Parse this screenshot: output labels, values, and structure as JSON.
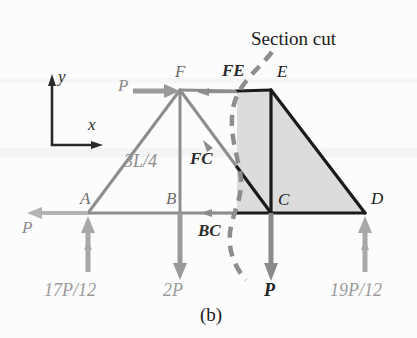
{
  "figure": {
    "caption": "(b)",
    "section_cut_label": "Section cut",
    "colors": {
      "light_member": "#8d8d8d",
      "dark_member": "#1a1a1a",
      "shaded_fill": "#dcdcdc",
      "dashed_cut": "#8d8d8d",
      "background": "#fcfcfc"
    }
  },
  "axes": {
    "x_label": "x",
    "y_label": "y"
  },
  "nodes": [
    {
      "name": "A",
      "label": "A",
      "x": 88,
      "y": 213,
      "tone": "light"
    },
    {
      "name": "B",
      "label": "B",
      "x": 180,
      "y": 213,
      "tone": "light"
    },
    {
      "name": "C",
      "label": "C",
      "x": 271,
      "y": 213,
      "tone": "dark"
    },
    {
      "name": "D",
      "label": "D",
      "x": 365,
      "y": 213,
      "tone": "dark"
    },
    {
      "name": "E",
      "label": "E",
      "x": 271,
      "y": 90,
      "tone": "dark"
    },
    {
      "name": "F",
      "label": "F",
      "x": 180,
      "y": 90,
      "tone": "light"
    }
  ],
  "dimensions": [
    {
      "name": "height-AF",
      "label": "3L/4"
    }
  ],
  "member_forces": [
    {
      "name": "FE",
      "label": "FE",
      "direction": "left",
      "member": "top-chord"
    },
    {
      "name": "FC",
      "label": "FC",
      "direction": "down-right",
      "member": "diagonal"
    },
    {
      "name": "BC",
      "label": "BC",
      "label_text": "BC",
      "direction": "left",
      "member": "bottom-chord"
    }
  ],
  "loads": [
    {
      "name": "load-P-at-F",
      "label": "P",
      "direction": "right",
      "tone": "light"
    },
    {
      "name": "load-P-at-A",
      "label": "P",
      "direction": "left",
      "tone": "light"
    },
    {
      "name": "load-2P-at-B",
      "label": "2P",
      "direction": "down",
      "tone": "light"
    },
    {
      "name": "load-P-at-C",
      "label": "P",
      "direction": "down",
      "tone": "dark"
    }
  ],
  "reactions": [
    {
      "name": "reaction-A",
      "label": "17P/12",
      "direction": "up",
      "tone": "light"
    },
    {
      "name": "reaction-D",
      "label": "19P/12",
      "direction": "up",
      "tone": "light"
    }
  ]
}
